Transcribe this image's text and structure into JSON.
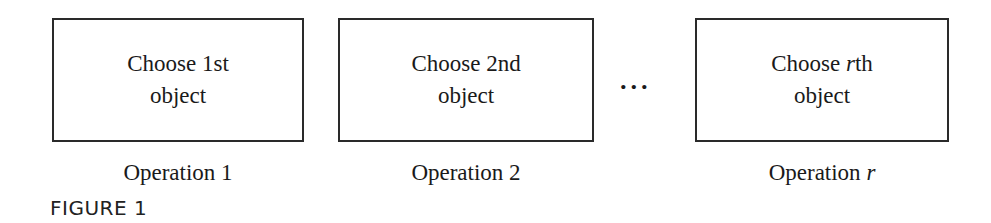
{
  "boxes": [
    {
      "line1_prefix": "Choose ",
      "line1_var": "",
      "line1_suffix": "1st",
      "line2": "object"
    },
    {
      "line1_prefix": "Choose ",
      "line1_var": "",
      "line1_suffix": "2nd",
      "line2": "object"
    },
    {
      "line1_prefix": "Choose ",
      "line1_var": "r",
      "line1_suffix": "th",
      "line2": "object"
    }
  ],
  "labels": [
    {
      "prefix": "Operation ",
      "var": "",
      "suffix": "1"
    },
    {
      "prefix": "Operation ",
      "var": "",
      "suffix": "2"
    },
    {
      "prefix": "Operation ",
      "var": "r",
      "suffix": ""
    }
  ],
  "ellipsis": "...",
  "caption": "FIGURE 1"
}
